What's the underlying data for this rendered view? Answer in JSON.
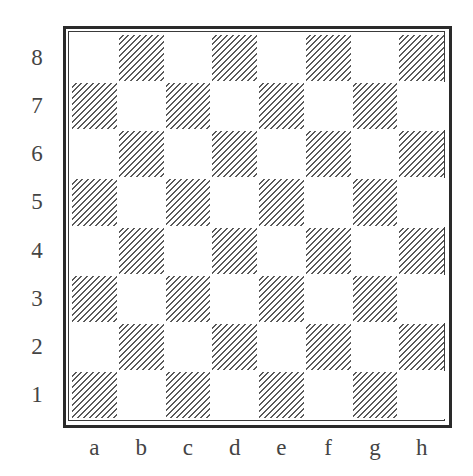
{
  "board": {
    "title": "Empty chessboard diagram",
    "files": [
      "a",
      "b",
      "c",
      "d",
      "e",
      "f",
      "g",
      "h"
    ],
    "ranks": [
      "8",
      "7",
      "6",
      "5",
      "4",
      "3",
      "2",
      "1"
    ],
    "dark_square_style": "diagonal-hatching",
    "light_square_color": "#ffffff",
    "hatch_color": "#5a5a5a",
    "border_color": "#2a2a2a",
    "label_color": "#444444",
    "pieces": []
  }
}
